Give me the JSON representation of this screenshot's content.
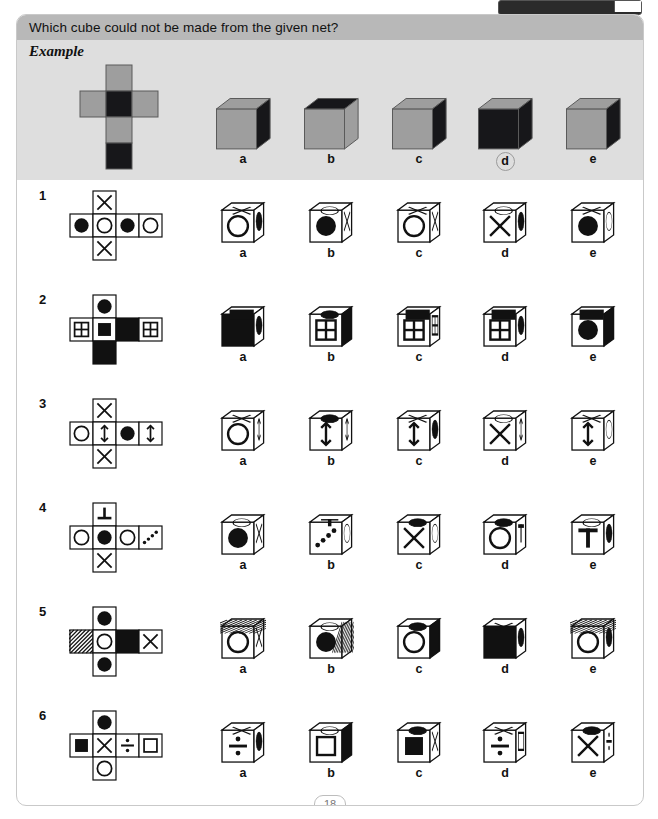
{
  "worksheet": {
    "question": "Which cube could not be made from the given net?",
    "example_label": "Example",
    "page_number": "18",
    "option_labels": [
      "a",
      "b",
      "c",
      "d",
      "e"
    ],
    "colors": {
      "question_bar": "#b8b8b8",
      "example_panel": "#dedede",
      "net_gray": "#9e9e9e",
      "ink": "#111111",
      "page_border": "#c9c9c9"
    }
  },
  "example": {
    "label": "Example",
    "answer": "d",
    "net": {
      "type": "cross",
      "top": "gray",
      "left": "gray",
      "center": "black",
      "right": "gray",
      "below_center": "gray",
      "bottom": "black"
    },
    "cubes": [
      {
        "label": "a",
        "top": "gray",
        "front": "gray",
        "side": "black",
        "circled": false
      },
      {
        "label": "b",
        "top": "black",
        "front": "gray",
        "side": "gray",
        "circled": false
      },
      {
        "label": "c",
        "top": "gray",
        "front": "gray",
        "side": "black",
        "circled": false
      },
      {
        "label": "d",
        "top": "gray",
        "front": "black",
        "side": "black",
        "circled": true
      },
      {
        "label": "e",
        "top": "gray",
        "front": "gray",
        "side": "black",
        "circled": false
      }
    ]
  },
  "questions": [
    {
      "number": "1",
      "net": {
        "top": "cross-x",
        "row": [
          "circle-filled",
          "circle-open",
          "circle-filled",
          "circle-open"
        ],
        "bottom": "cross-x"
      },
      "cubes": [
        {
          "label": "a",
          "top": "cross-x",
          "front": "circle-open",
          "side": "ellipse-filled"
        },
        {
          "label": "b",
          "top": "ellipse-open",
          "front": "circle-filled",
          "side": "cross-x"
        },
        {
          "label": "c",
          "top": "cross-x",
          "front": "circle-open",
          "side": "cross-x"
        },
        {
          "label": "d",
          "top": "ellipse-open",
          "front": "cross-x",
          "side": "ellipse-filled"
        },
        {
          "label": "e",
          "top": "cross-x",
          "front": "circle-filled",
          "side": "ellipse-open"
        }
      ]
    },
    {
      "number": "2",
      "net": {
        "top": "circle-filled",
        "row": [
          "grid-four",
          "square-filled",
          "solid-black",
          "grid-four"
        ],
        "bottom": "solid-black"
      },
      "cubes": [
        {
          "label": "a",
          "top": "solid-black-rect",
          "front": "solid-black",
          "side": "ellipse-filled"
        },
        {
          "label": "b",
          "top": "ellipse-filled",
          "front": "grid-four",
          "side": "solid-black"
        },
        {
          "label": "c",
          "top": "solid-black-rect",
          "front": "grid-four",
          "side": "grid-four"
        },
        {
          "label": "d",
          "top": "solid-black-rect",
          "front": "grid-four",
          "side": "ellipse-filled"
        },
        {
          "label": "e",
          "top": "solid-black-rect",
          "front": "circle-filled",
          "side": "solid-black"
        }
      ]
    },
    {
      "number": "3",
      "net": {
        "top": "cross-x",
        "row": [
          "circle-open",
          "arrow-double",
          "circle-filled",
          "arrow-double"
        ],
        "bottom": "cross-x"
      },
      "cubes": [
        {
          "label": "a",
          "top": "cross-x",
          "front": "circle-open",
          "side": "arrow-double"
        },
        {
          "label": "b",
          "top": "ellipse-filled",
          "front": "arrow-double",
          "side": "arrow-double"
        },
        {
          "label": "c",
          "top": "cross-x",
          "front": "arrow-double",
          "side": "ellipse-filled"
        },
        {
          "label": "d",
          "top": "ellipse-open",
          "front": "cross-x",
          "side": "arrow-double"
        },
        {
          "label": "e",
          "top": "cross-x",
          "front": "arrow-double",
          "side": "ellipse-open"
        }
      ]
    },
    {
      "number": "4",
      "net": {
        "top": "tee-down",
        "row": [
          "circle-open",
          "circle-filled",
          "circle-open",
          "dots-four"
        ],
        "bottom": "cross-x"
      },
      "cubes": [
        {
          "label": "a",
          "top": "ellipse-open",
          "front": "circle-filled",
          "side": "cross-x"
        },
        {
          "label": "b",
          "top": "tee-letter",
          "front": "dots-four",
          "side": "ellipse-open"
        },
        {
          "label": "c",
          "top": "ellipse-filled",
          "front": "cross-x",
          "side": "ellipse-open"
        },
        {
          "label": "d",
          "top": "ellipse-filled",
          "front": "circle-open",
          "side": "tee-letter"
        },
        {
          "label": "e",
          "top": "ellipse-open",
          "front": "tee-letter",
          "side": "ellipse-filled"
        }
      ]
    },
    {
      "number": "5",
      "net": {
        "top": "circle-filled",
        "row": [
          "hatched",
          "circle-open",
          "solid-black",
          "cross-x"
        ],
        "bottom": "circle-filled"
      },
      "cubes": [
        {
          "label": "a",
          "top": "hatched",
          "front": "circle-open",
          "side": "cross-x"
        },
        {
          "label": "b",
          "top": "ellipse-open",
          "front": "circle-filled",
          "side": "hatched"
        },
        {
          "label": "c",
          "top": "ellipse-filled",
          "front": "circle-open",
          "side": "solid-black"
        },
        {
          "label": "d",
          "top": "cross-x",
          "front": "solid-black",
          "side": "ellipse-filled"
        },
        {
          "label": "e",
          "top": "hatched",
          "front": "circle-open",
          "side": "ellipse-filled"
        }
      ]
    },
    {
      "number": "6",
      "net": {
        "top": "circle-filled",
        "row": [
          "square-filled",
          "cross-x",
          "divide-sign",
          "square-open"
        ],
        "bottom": "circle-open"
      },
      "cubes": [
        {
          "label": "a",
          "top": "cross-x",
          "front": "divide-sign",
          "side": "ellipse-filled"
        },
        {
          "label": "b",
          "top": "ellipse-open",
          "front": "square-open",
          "side": "solid-black"
        },
        {
          "label": "c",
          "top": "ellipse-filled",
          "front": "square-filled",
          "side": "cross-x"
        },
        {
          "label": "d",
          "top": "cross-x",
          "front": "divide-sign",
          "side": "square-open"
        },
        {
          "label": "e",
          "top": "ellipse-filled",
          "front": "cross-x",
          "side": "divide-sign"
        }
      ]
    }
  ]
}
